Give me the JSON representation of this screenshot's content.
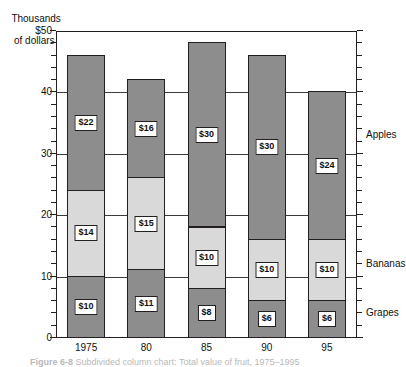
{
  "chart_data": {
    "type": "bar",
    "subtype": "stacked-column",
    "title": "",
    "ylabel_line1": "Thousands",
    "ylabel_line2": "of dollars",
    "xlabel": "",
    "categories": [
      "1975",
      "80",
      "85",
      "90",
      "95"
    ],
    "series": [
      {
        "name": "Grapes",
        "values": [
          10,
          11,
          8,
          6,
          6
        ],
        "color": "#8d8d8d"
      },
      {
        "name": "Bananas",
        "values": [
          14,
          15,
          10,
          10,
          10
        ],
        "color": "#d9d9d9"
      },
      {
        "name": "Apples",
        "values": [
          22,
          16,
          30,
          30,
          24
        ],
        "color": "#8d8d8d"
      }
    ],
    "totals": [
      46,
      42,
      48,
      46,
      40
    ],
    "ylim": [
      0,
      50
    ],
    "ytick_labels": [
      "$50",
      "40",
      "30",
      "20",
      "10",
      "0"
    ],
    "ytick_values": [
      50,
      40,
      30,
      20,
      10,
      0
    ],
    "minor_tick_step": 2,
    "gridline_values": [
      40,
      30,
      20,
      10
    ],
    "grid": true,
    "legend_position": "right-inline",
    "value_labels": {
      "grapes": [
        "$10",
        "$11",
        "$8",
        "$6",
        "$6"
      ],
      "bananas": [
        "$14",
        "$15",
        "$10",
        "$10",
        "$10"
      ],
      "apples": [
        "$22",
        "$16",
        "$30",
        "$30",
        "$24"
      ]
    },
    "series_label_positions": {
      "apples": 33,
      "bananas": 12,
      "grapes": 4
    }
  },
  "caption": {
    "figure_number": "Figure 6-8",
    "text": "Subdivided column chart: Total value of fruit, 1975–1995"
  }
}
